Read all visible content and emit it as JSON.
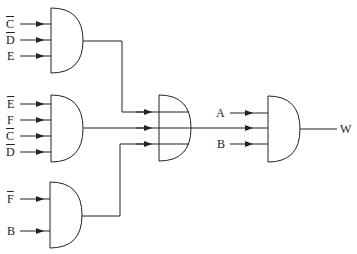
{
  "diagram": {
    "type": "logic-circuit",
    "gates": [
      {
        "id": "and1",
        "type": "AND",
        "inputs": [
          "C̄",
          "D̄",
          "E"
        ]
      },
      {
        "id": "and2",
        "type": "AND",
        "inputs": [
          "Ē",
          "F",
          "C̄",
          "D̄"
        ]
      },
      {
        "id": "and3",
        "type": "AND",
        "inputs": [
          "F̄",
          "B"
        ]
      },
      {
        "id": "and4",
        "type": "AND",
        "inputs": [
          "and1",
          "and2",
          "and3"
        ]
      },
      {
        "id": "and5",
        "type": "AND",
        "inputs": [
          "A",
          "and4",
          "B"
        ],
        "output": "W"
      }
    ],
    "labels": {
      "g1_in1": "C",
      "g1_in2": "D",
      "g1_in3": "E",
      "g2_in1": "E",
      "g2_in2": "F",
      "g2_in3": "C",
      "g2_in4": "D",
      "g3_in1": "F",
      "g3_in2": "B",
      "g5_a": "A",
      "g5_b": "B",
      "output": "W"
    },
    "colors": {
      "stroke": "#222222",
      "background": "#ffffff"
    }
  }
}
